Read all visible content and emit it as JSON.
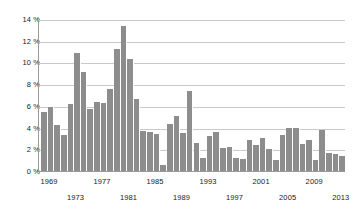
{
  "chart_data": {
    "type": "bar",
    "title": "",
    "subtitle": "",
    "xlabel": "",
    "ylabel": "",
    "ylim": [
      0,
      14
    ],
    "ytick_values": [
      0,
      2,
      4,
      6,
      8,
      10,
      12,
      14
    ],
    "ytick_labels": [
      "0 %",
      "2 %",
      "4 %",
      "6 %",
      "8 %",
      "10 %",
      "12 %",
      "14 %"
    ],
    "grid": "horizontal",
    "legend": "none",
    "bar_color": "#8d8d8d",
    "gridline_color": "#c9c9c9",
    "axis_color": "#9a9a9a",
    "text_color": "#1a1a1a",
    "background_color": "#ffffff",
    "xtick_labels": [
      "1969",
      "1973",
      "1977",
      "1981",
      "1985",
      "1989",
      "1993",
      "1997",
      "2001",
      "2005",
      "2009",
      "2013"
    ],
    "xtick_rows": [
      0,
      1,
      0,
      1,
      0,
      1,
      0,
      1,
      0,
      1,
      0,
      1
    ],
    "categories": [
      "1968",
      "1969",
      "1970",
      "1971",
      "1972",
      "1973",
      "1974",
      "1975",
      "1976",
      "1977",
      "1978",
      "1979",
      "1980",
      "1981",
      "1982",
      "1983",
      "1984",
      "1985",
      "1986",
      "1987",
      "1988",
      "1989",
      "1990",
      "1991",
      "1992",
      "1993",
      "1994",
      "1995",
      "1996",
      "1997",
      "1998",
      "1999",
      "2000",
      "2001",
      "2002",
      "2003",
      "2004",
      "2005",
      "2006",
      "2007",
      "2008",
      "2009",
      "2010",
      "2011",
      "2012",
      "2013"
    ],
    "values": [
      5.4,
      5.9,
      4.2,
      3.3,
      6.2,
      10.9,
      9.1,
      5.7,
      6.4,
      6.3,
      7.6,
      11.2,
      13.4,
      10.3,
      6.6,
      3.7,
      3.6,
      3.4,
      0.6,
      4.3,
      5.1,
      3.5,
      7.4,
      2.6,
      1.2,
      3.2,
      3.6,
      2.1,
      2.2,
      1.2,
      1.1,
      2.9,
      2.4,
      3.0,
      2.0,
      1.0,
      3.3,
      4.0,
      4.0,
      2.5,
      2.9,
      1.0,
      3.8,
      1.7,
      1.6,
      1.4
    ]
  }
}
